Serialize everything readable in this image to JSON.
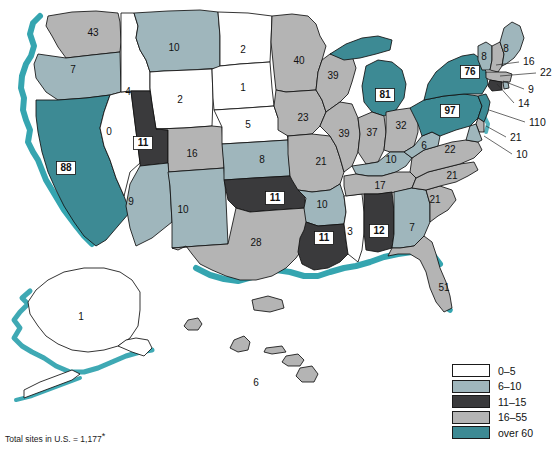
{
  "figure": {
    "total_note_prefix": "Total sites in U.S. = ",
    "total_note_value": "1,177",
    "total_note_asterisk": "*"
  },
  "legend": {
    "name": "legend",
    "items": [
      {
        "label": "0–5",
        "color": "#ffffff",
        "key": "c0_5"
      },
      {
        "label": "6–10",
        "color": "#9fb6bc",
        "key": "c6_10"
      },
      {
        "label": "11–15",
        "color": "#3a3a3c",
        "key": "c11_15"
      },
      {
        "label": "16–55",
        "color": "#b4b4b4",
        "key": "c16_55"
      },
      {
        "label": "over 60",
        "color": "#3d8a94",
        "key": "cover60"
      }
    ]
  },
  "colors": {
    "c0_5": "#ffffff",
    "c6_10": "#9fb6bc",
    "c11_15": "#3a3a3c",
    "c16_55": "#b4b4b4",
    "cover60": "#3d8a94",
    "coast": "#2aa0ac",
    "outline": "#111111"
  },
  "chart_data": {
    "type": "map",
    "title": "",
    "units": "sites",
    "total": 1177,
    "classes": [
      {
        "label": "0–5",
        "min": 0,
        "max": 5,
        "color": "#ffffff"
      },
      {
        "label": "6–10",
        "min": 6,
        "max": 10,
        "color": "#9fb6bc"
      },
      {
        "label": "11–15",
        "min": 11,
        "max": 15,
        "color": "#3a3a3c"
      },
      {
        "label": "16–55",
        "min": 16,
        "max": 55,
        "color": "#b4b4b4"
      },
      {
        "label": "over 60",
        "min": 60,
        "max": null,
        "color": "#3d8a94"
      }
    ],
    "states": [
      {
        "code": "WA",
        "value": 43,
        "class": "16–55"
      },
      {
        "code": "OR",
        "value": 7,
        "class": "6–10"
      },
      {
        "code": "CA",
        "value": 88,
        "class": "over 60"
      },
      {
        "code": "NV",
        "value": 0,
        "class": "0–5"
      },
      {
        "code": "ID",
        "value": 4,
        "class": "0–5"
      },
      {
        "code": "MT",
        "value": 10,
        "class": "6–10"
      },
      {
        "code": "WY",
        "value": 2,
        "class": "0–5"
      },
      {
        "code": "UT",
        "value": 11,
        "class": "11–15"
      },
      {
        "code": "AZ",
        "value": 9,
        "class": "6–10"
      },
      {
        "code": "NM",
        "value": 10,
        "class": "6–10"
      },
      {
        "code": "CO",
        "value": 16,
        "class": "16–55"
      },
      {
        "code": "ND",
        "value": 2,
        "class": "0–5"
      },
      {
        "code": "SD",
        "value": 1,
        "class": "0–5"
      },
      {
        "code": "NE",
        "value": 5,
        "class": "0–5"
      },
      {
        "code": "KS",
        "value": 8,
        "class": "6–10"
      },
      {
        "code": "OK",
        "value": 11,
        "class": "11–15"
      },
      {
        "code": "TX",
        "value": 28,
        "class": "16–55"
      },
      {
        "code": "MN",
        "value": 40,
        "class": "16–55"
      },
      {
        "code": "IA",
        "value": 23,
        "class": "16–55"
      },
      {
        "code": "MO",
        "value": 21,
        "class": "16–55"
      },
      {
        "code": "AR",
        "value": 10,
        "class": "6–10"
      },
      {
        "code": "LA",
        "value": 11,
        "class": "11–15"
      },
      {
        "code": "WI",
        "value": 39,
        "class": "16–55"
      },
      {
        "code": "IL",
        "value": 39,
        "class": "16–55"
      },
      {
        "code": "MS",
        "value": 3,
        "class": "0–5"
      },
      {
        "code": "MI",
        "value": 81,
        "class": "over 60"
      },
      {
        "code": "IN",
        "value": 37,
        "class": "16–55"
      },
      {
        "code": "OH",
        "value": 32,
        "class": "16–55"
      },
      {
        "code": "KY",
        "value": 10,
        "class": "6–10"
      },
      {
        "code": "TN",
        "value": 17,
        "class": "16–55"
      },
      {
        "code": "AL",
        "value": 12,
        "class": "11–15"
      },
      {
        "code": "GA",
        "value": 7,
        "class": "6–10"
      },
      {
        "code": "FL",
        "value": 51,
        "class": "16–55"
      },
      {
        "code": "SC",
        "value": 21,
        "class": "16–55"
      },
      {
        "code": "NC",
        "value": 21,
        "class": "16–55"
      },
      {
        "code": "VA",
        "value": 22,
        "class": "16–55"
      },
      {
        "code": "WV",
        "value": 6,
        "class": "6–10"
      },
      {
        "code": "PA",
        "value": 97,
        "class": "over 60"
      },
      {
        "code": "NY",
        "value": 76,
        "class": "over 60"
      },
      {
        "code": "VT",
        "value": 8,
        "class": "6–10"
      },
      {
        "code": "ME",
        "value": 8,
        "class": "6–10"
      },
      {
        "code": "NH",
        "value": 16,
        "class": "16–55"
      },
      {
        "code": "MA",
        "value": 22,
        "class": "16–55"
      },
      {
        "code": "RI",
        "value": 9,
        "class": "6–10"
      },
      {
        "code": "CT",
        "value": 14,
        "class": "11–15"
      },
      {
        "code": "NJ",
        "value": 110,
        "class": "over 60"
      },
      {
        "code": "DE",
        "value": 21,
        "class": "16–55"
      },
      {
        "code": "MD",
        "value": 10,
        "class": "6–10"
      },
      {
        "code": "AK",
        "value": 1,
        "class": "0–5"
      },
      {
        "code": "HI",
        "value": 6,
        "class": "6–10"
      }
    ]
  },
  "map": {
    "inline_labels": [
      {
        "code": "WA",
        "text": "43",
        "x": 93,
        "y": 33
      },
      {
        "code": "OR",
        "text": "7",
        "x": 73,
        "y": 70
      },
      {
        "code": "CA",
        "text": "88",
        "x": 66,
        "y": 168,
        "boxed": true
      },
      {
        "code": "NV",
        "text": "0",
        "x": 109,
        "y": 132
      },
      {
        "code": "ID",
        "text": "4",
        "x": 128,
        "y": 92
      },
      {
        "code": "MT",
        "text": "10",
        "x": 174,
        "y": 48
      },
      {
        "code": "WY",
        "text": "2",
        "x": 180,
        "y": 100
      },
      {
        "code": "UT",
        "text": "11",
        "x": 143,
        "y": 143,
        "boxed": true
      },
      {
        "code": "AZ",
        "text": "9",
        "x": 131,
        "y": 202
      },
      {
        "code": "NM",
        "text": "10",
        "x": 183,
        "y": 210
      },
      {
        "code": "CO",
        "text": "16",
        "x": 192,
        "y": 154
      },
      {
        "code": "ND",
        "text": "2",
        "x": 243,
        "y": 50
      },
      {
        "code": "SD",
        "text": "1",
        "x": 243,
        "y": 88
      },
      {
        "code": "NE",
        "text": "5",
        "x": 248,
        "y": 125
      },
      {
        "code": "KS",
        "text": "8",
        "x": 262,
        "y": 160
      },
      {
        "code": "OK",
        "text": "11",
        "x": 275,
        "y": 198,
        "boxed": true
      },
      {
        "code": "TX",
        "text": "28",
        "x": 256,
        "y": 243
      },
      {
        "code": "MN",
        "text": "40",
        "x": 299,
        "y": 61
      },
      {
        "code": "IA",
        "text": "23",
        "x": 303,
        "y": 118
      },
      {
        "code": "MO",
        "text": "21",
        "x": 321,
        "y": 162
      },
      {
        "code": "AR",
        "text": "10",
        "x": 322,
        "y": 205
      },
      {
        "code": "LA",
        "text": "11",
        "x": 324,
        "y": 238,
        "boxed": true
      },
      {
        "code": "WI",
        "text": "39",
        "x": 333,
        "y": 76
      },
      {
        "code": "IL",
        "text": "39",
        "x": 344,
        "y": 134
      },
      {
        "code": "MS",
        "text": "3",
        "x": 350,
        "y": 232
      },
      {
        "code": "MI",
        "text": "81",
        "x": 385,
        "y": 95,
        "boxed": true
      },
      {
        "code": "IN",
        "text": "37",
        "x": 372,
        "y": 133
      },
      {
        "code": "OH",
        "text": "32",
        "x": 401,
        "y": 126
      },
      {
        "code": "KY",
        "text": "10",
        "x": 391,
        "y": 160
      },
      {
        "code": "TN",
        "text": "17",
        "x": 380,
        "y": 186
      },
      {
        "code": "AL",
        "text": "12",
        "x": 379,
        "y": 231,
        "boxed": true
      },
      {
        "code": "GA",
        "text": "7",
        "x": 412,
        "y": 228
      },
      {
        "code": "FL",
        "text": "51",
        "x": 444,
        "y": 288
      },
      {
        "code": "SC",
        "text": "21",
        "x": 435,
        "y": 200
      },
      {
        "code": "NC",
        "text": "21",
        "x": 452,
        "y": 176
      },
      {
        "code": "VA",
        "text": "22",
        "x": 450,
        "y": 150
      },
      {
        "code": "WV",
        "text": "6",
        "x": 424,
        "y": 146
      },
      {
        "code": "PA",
        "text": "97",
        "x": 450,
        "y": 111,
        "boxed": true
      },
      {
        "code": "NY",
        "text": "76",
        "x": 470,
        "y": 72,
        "boxed": true
      },
      {
        "code": "VT",
        "text": "8",
        "x": 484,
        "y": 57
      },
      {
        "code": "ME",
        "text": "8",
        "x": 506,
        "y": 49
      },
      {
        "code": "AK",
        "text": "1",
        "x": 81,
        "y": 317
      },
      {
        "code": "HI",
        "text": "6",
        "x": 256,
        "y": 383
      }
    ],
    "callouts": [
      {
        "code": "NH",
        "text": "16",
        "tx": 523,
        "ty": 62,
        "lx1": 496,
        "ly1": 65,
        "lx2": 519,
        "ly2": 62
      },
      {
        "code": "MA",
        "text": "22",
        "tx": 540,
        "ty": 73,
        "lx1": 500,
        "ly1": 76,
        "lx2": 536,
        "ly2": 73
      },
      {
        "code": "RI",
        "text": "9",
        "tx": 528,
        "ty": 90,
        "lx1": 503,
        "ly1": 81,
        "lx2": 524,
        "ly2": 89
      },
      {
        "code": "CT",
        "text": "14",
        "tx": 518,
        "ty": 104,
        "lx1": 497,
        "ly1": 84,
        "lx2": 514,
        "ly2": 103
      },
      {
        "code": "NJ",
        "text": "110",
        "tx": 529,
        "ty": 123,
        "lx1": 489,
        "ly1": 110,
        "lx2": 525,
        "ly2": 122
      },
      {
        "code": "DE",
        "text": "21",
        "tx": 510,
        "ty": 138,
        "lx1": 486,
        "ly1": 126,
        "lx2": 506,
        "ly2": 137
      },
      {
        "code": "MD",
        "text": "10",
        "tx": 516,
        "ty": 155,
        "lx1": 484,
        "ly1": 136,
        "lx2": 512,
        "ly2": 154
      }
    ]
  }
}
